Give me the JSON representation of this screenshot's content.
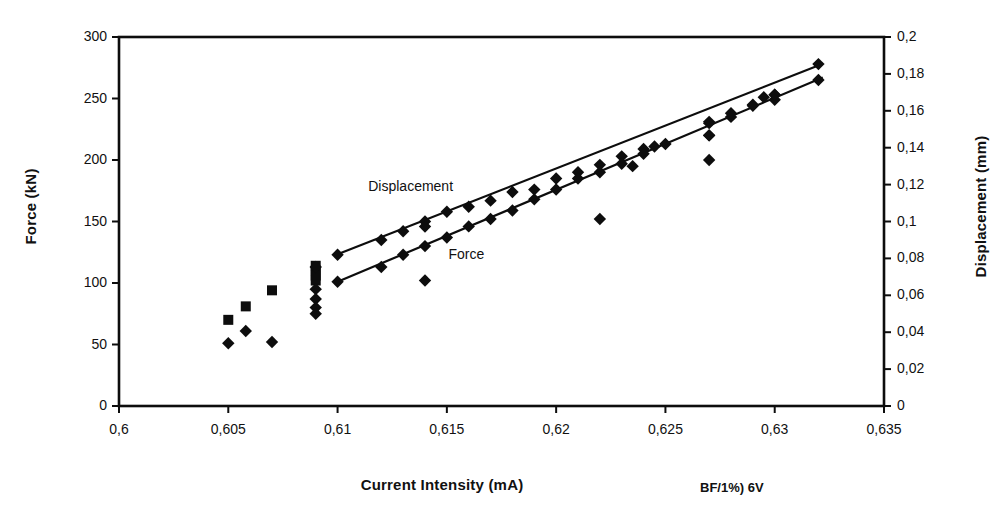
{
  "chart_data": {
    "type": "scatter",
    "title": "",
    "annotation": "BF/1%) 6V",
    "xlabel": "Current Intensity (mA)",
    "xlim": [
      0.6,
      0.635
    ],
    "xticks": [
      "0,6",
      "0,605",
      "0,61",
      "0,615",
      "0,62",
      "0,625",
      "0,63",
      "0,635"
    ],
    "xtick_values": [
      0.6,
      0.605,
      0.61,
      0.615,
      0.62,
      0.625,
      0.63,
      0.635
    ],
    "grid": false,
    "legend_position": "in-plot-inline",
    "axes": [
      {
        "id": "left",
        "label": "Force (kN)",
        "lim": [
          0,
          300
        ],
        "ticks": [
          "0",
          "50",
          "100",
          "150",
          "200",
          "250",
          "300"
        ],
        "tick_values": [
          0,
          50,
          100,
          150,
          200,
          250,
          300
        ]
      },
      {
        "id": "right",
        "label": "Displacement (mm)",
        "lim": [
          0,
          0.2
        ],
        "ticks": [
          "0",
          "0,02",
          "0,04",
          "0,06",
          "0,08",
          "0,1",
          "0,12",
          "0,14",
          "0,16",
          "0,18",
          "0,2"
        ],
        "tick_values": [
          0,
          0.02,
          0.04,
          0.06,
          0.08,
          0.1,
          0.12,
          0.14,
          0.16,
          0.18,
          0.2
        ]
      }
    ],
    "series": [
      {
        "name": "Displacement",
        "axis": "right",
        "marker": "square-diamond",
        "inline_label": "Displacement",
        "inline_label_x": 0.6122,
        "inline_label_y": 0.1185,
        "trendline": {
          "x": [
            0.61,
            0.6322
          ],
          "y": [
            0.0822,
            0.1855
          ]
        },
        "points": [
          {
            "x": 0.605,
            "y": 0.0467
          },
          {
            "x": 0.6058,
            "y": 0.054
          },
          {
            "x": 0.607,
            "y": 0.0627
          },
          {
            "x": 0.609,
            "y": 0.076
          },
          {
            "x": 0.609,
            "y": 0.0733
          },
          {
            "x": 0.609,
            "y": 0.0707
          },
          {
            "x": 0.609,
            "y": 0.068
          },
          {
            "x": 0.61,
            "y": 0.082
          },
          {
            "x": 0.612,
            "y": 0.09
          },
          {
            "x": 0.613,
            "y": 0.0947
          },
          {
            "x": 0.614,
            "y": 0.1
          },
          {
            "x": 0.614,
            "y": 0.0973
          },
          {
            "x": 0.615,
            "y": 0.1053
          },
          {
            "x": 0.616,
            "y": 0.108
          },
          {
            "x": 0.617,
            "y": 0.1113
          },
          {
            "x": 0.618,
            "y": 0.116
          },
          {
            "x": 0.619,
            "y": 0.1173
          },
          {
            "x": 0.62,
            "y": 0.1233
          },
          {
            "x": 0.621,
            "y": 0.1267
          },
          {
            "x": 0.622,
            "y": 0.1307
          },
          {
            "x": 0.623,
            "y": 0.1353
          },
          {
            "x": 0.6235,
            "y": 0.13
          },
          {
            "x": 0.624,
            "y": 0.1393
          },
          {
            "x": 0.625,
            "y": 0.142
          },
          {
            "x": 0.627,
            "y": 0.1533
          },
          {
            "x": 0.627,
            "y": 0.1467
          },
          {
            "x": 0.628,
            "y": 0.1567
          },
          {
            "x": 0.629,
            "y": 0.1627
          },
          {
            "x": 0.63,
            "y": 0.1687
          },
          {
            "x": 0.63,
            "y": 0.166
          },
          {
            "x": 0.632,
            "y": 0.1853
          }
        ]
      },
      {
        "name": "Force",
        "axis": "left",
        "marker": "diamond",
        "inline_label": "Force",
        "inline_label_x": 0.61475,
        "inline_label_y": 123,
        "trendline": {
          "x": [
            0.61,
            0.6322
          ],
          "y": [
            101,
            267
          ]
        },
        "points": [
          {
            "x": 0.605,
            "y": 51
          },
          {
            "x": 0.6058,
            "y": 61
          },
          {
            "x": 0.607,
            "y": 52
          },
          {
            "x": 0.609,
            "y": 113
          },
          {
            "x": 0.609,
            "y": 95
          },
          {
            "x": 0.609,
            "y": 87
          },
          {
            "x": 0.609,
            "y": 80
          },
          {
            "x": 0.609,
            "y": 75
          },
          {
            "x": 0.61,
            "y": 101
          },
          {
            "x": 0.612,
            "y": 113
          },
          {
            "x": 0.613,
            "y": 123
          },
          {
            "x": 0.614,
            "y": 130
          },
          {
            "x": 0.614,
            "y": 102
          },
          {
            "x": 0.615,
            "y": 137
          },
          {
            "x": 0.616,
            "y": 146
          },
          {
            "x": 0.617,
            "y": 152
          },
          {
            "x": 0.618,
            "y": 159
          },
          {
            "x": 0.619,
            "y": 168
          },
          {
            "x": 0.62,
            "y": 176
          },
          {
            "x": 0.621,
            "y": 185
          },
          {
            "x": 0.622,
            "y": 190
          },
          {
            "x": 0.622,
            "y": 152
          },
          {
            "x": 0.623,
            "y": 197
          },
          {
            "x": 0.624,
            "y": 205
          },
          {
            "x": 0.6245,
            "y": 211
          },
          {
            "x": 0.627,
            "y": 231
          },
          {
            "x": 0.627,
            "y": 220
          },
          {
            "x": 0.627,
            "y": 200
          },
          {
            "x": 0.628,
            "y": 238
          },
          {
            "x": 0.629,
            "y": 245
          },
          {
            "x": 0.6295,
            "y": 251
          },
          {
            "x": 0.63,
            "y": 253
          },
          {
            "x": 0.632,
            "y": 265
          }
        ]
      }
    ],
    "colors": {
      "marker": "#0d0d0d",
      "line": "#0d0d0d",
      "axis": "#0d0d0d",
      "background": "#ffffff"
    }
  }
}
